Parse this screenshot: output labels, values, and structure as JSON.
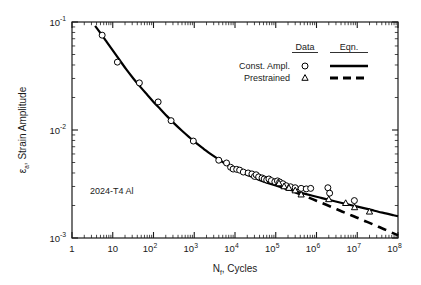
{
  "chart_data": {
    "type": "line",
    "title": "",
    "xlabel": "N_f, Cycles",
    "ylabel": "ε_a, Strain Amplitude",
    "xscale": "log",
    "yscale": "log",
    "xlim": [
      1,
      100000000
    ],
    "ylim": [
      0.001,
      0.1
    ],
    "grid": false,
    "annotation": "2024-T4 Al",
    "legend": {
      "position": "top-right",
      "col_headers": [
        "Data",
        "Eqn."
      ],
      "rows": [
        {
          "label": "Const. Ampl.",
          "marker": "circle",
          "line": "solid"
        },
        {
          "label": "Prestrained",
          "marker": "triangle",
          "line": "dashed"
        }
      ]
    },
    "xticks": [
      {
        "value": 1,
        "label": "1",
        "mantissa": "",
        "exp": ""
      },
      {
        "value": 10,
        "label": "10",
        "mantissa": "10",
        "exp": ""
      },
      {
        "value": 100,
        "label": "10^2",
        "mantissa": "10",
        "exp": "2"
      },
      {
        "value": 1000,
        "label": "10^3",
        "mantissa": "10",
        "exp": "3"
      },
      {
        "value": 10000,
        "label": "10^4",
        "mantissa": "10",
        "exp": "4"
      },
      {
        "value": 100000,
        "label": "10^5",
        "mantissa": "10",
        "exp": "5"
      },
      {
        "value": 1000000,
        "label": "10^6",
        "mantissa": "10",
        "exp": "6"
      },
      {
        "value": 10000000,
        "label": "10^7",
        "mantissa": "10",
        "exp": "7"
      },
      {
        "value": 100000000,
        "label": "10^8",
        "mantissa": "10",
        "exp": "8"
      }
    ],
    "yticks": [
      {
        "value": 0.001,
        "label": "10^-3",
        "mantissa": "10",
        "exp": "-3"
      },
      {
        "value": 0.01,
        "label": "10^-2",
        "mantissa": "10",
        "exp": "-2"
      },
      {
        "value": 0.1,
        "label": "10^-1",
        "mantissa": "10",
        "exp": "-1"
      }
    ],
    "series": [
      {
        "name": "Const. Ampl.",
        "kind": "scatter",
        "marker": "circle",
        "points": [
          [
            5.5,
            0.0755
          ],
          [
            13.0,
            0.0425
          ],
          [
            45.0,
            0.0273
          ],
          [
            130.0,
            0.0182
          ],
          [
            270.0,
            0.0122
          ],
          [
            950.0,
            0.0079
          ],
          [
            4000.0,
            0.00525
          ],
          [
            6200.0,
            0.00495
          ],
          [
            7800.0,
            0.00452
          ],
          [
            9000.0,
            0.00435
          ],
          [
            11000.0,
            0.00432
          ],
          [
            13000.0,
            0.00425
          ],
          [
            16000.0,
            0.00408
          ],
          [
            21000.0,
            0.004
          ],
          [
            26000.0,
            0.00392
          ],
          [
            30000.0,
            0.00372
          ],
          [
            33000.0,
            0.00385
          ],
          [
            38000.0,
            0.00368
          ],
          [
            46000.0,
            0.0036
          ],
          [
            52000.0,
            0.00352
          ],
          [
            60000.0,
            0.00345
          ],
          [
            68000.0,
            0.00352
          ],
          [
            78000.0,
            0.0034
          ],
          [
            95000.0,
            0.00332
          ],
          [
            110000.0,
            0.00338
          ],
          [
            125000.0,
            0.0033
          ],
          [
            150000.0,
            0.00318
          ],
          [
            180000.0,
            0.00305
          ],
          [
            230000.0,
            0.00298
          ],
          [
            300000.0,
            0.00292
          ],
          [
            420000.0,
            0.00288
          ],
          [
            560000.0,
            0.00285
          ],
          [
            720000.0,
            0.00288
          ],
          [
            1900000.0,
            0.00292
          ],
          [
            2100000.0,
            0.0026
          ],
          [
            8500000.0,
            0.00222
          ]
        ]
      },
      {
        "name": "Prestrained",
        "kind": "scatter",
        "marker": "triangle",
        "points": [
          [
            120000.0,
            0.0032
          ],
          [
            160000.0,
            0.003
          ],
          [
            210000.0,
            0.0029
          ],
          [
            300000.0,
            0.00275
          ],
          [
            420000.0,
            0.00252
          ],
          [
            2000000.0,
            0.00228
          ],
          [
            5200000.0,
            0.0021
          ],
          [
            8600000.0,
            0.00192
          ],
          [
            20000000.0,
            0.00175
          ]
        ]
      },
      {
        "name": "Eqn. Const. Ampl.",
        "kind": "line",
        "style": "solid",
        "points": [
          [
            3.7,
            0.092
          ],
          [
            5.0,
            0.079
          ],
          [
            7.0,
            0.066
          ],
          [
            10.0,
            0.0545
          ],
          [
            15.0,
            0.044
          ],
          [
            22.0,
            0.036
          ],
          [
            32.0,
            0.03
          ],
          [
            47.0,
            0.0252
          ],
          [
            70.0,
            0.0212
          ],
          [
            100.0,
            0.0182
          ],
          [
            150.0,
            0.0155
          ],
          [
            220.0,
            0.0133
          ],
          [
            330.0,
            0.0114
          ],
          [
            500.0,
            0.00985
          ],
          [
            750.0,
            0.0086
          ],
          [
            1100.0,
            0.0076
          ],
          [
            1700.0,
            0.0067
          ],
          [
            2500.0,
            0.006
          ],
          [
            3800.0,
            0.0054
          ],
          [
            5600.0,
            0.00492
          ],
          [
            8500.0,
            0.0045
          ],
          [
            13000.0,
            0.00415
          ],
          [
            19000.0,
            0.00387
          ],
          [
            29000.0,
            0.00362
          ],
          [
            44000.0,
            0.0034
          ],
          [
            66000.0,
            0.00322
          ],
          [
            100000.0,
            0.00306
          ],
          [
            150000.0,
            0.00292
          ],
          [
            230000.0,
            0.00279
          ],
          [
            350000.0,
            0.00267
          ],
          [
            530000.0,
            0.00256
          ],
          [
            800000.0,
            0.00246
          ],
          [
            1200000.0,
            0.00237
          ],
          [
            1800000.0,
            0.00228
          ],
          [
            2800000.0,
            0.00219
          ],
          [
            4200000.0,
            0.00211
          ],
          [
            6400000.0,
            0.00203
          ],
          [
            9600000.0,
            0.00196
          ],
          [
            14500000.0,
            0.00189
          ],
          [
            22000000.0,
            0.00182
          ],
          [
            33000000.0,
            0.00175
          ],
          [
            50000000.0,
            0.00169
          ],
          [
            75000000.0,
            0.00163
          ],
          [
            100000000.0,
            0.00159
          ]
        ]
      },
      {
        "name": "Eqn. Prestrained",
        "kind": "line",
        "style": "dashed",
        "points": [
          [
            60000.0,
            0.00333
          ],
          [
            100000.0,
            0.00312
          ],
          [
            150000.0,
            0.00295
          ],
          [
            230000.0,
            0.00277
          ],
          [
            350000.0,
            0.0026
          ],
          [
            530000.0,
            0.00244
          ],
          [
            800000.0,
            0.00229
          ],
          [
            1200000.0,
            0.00215
          ],
          [
            1800000.0,
            0.00202
          ],
          [
            2800000.0,
            0.00188
          ],
          [
            4200000.0,
            0.00176
          ],
          [
            6400000.0,
            0.00165
          ],
          [
            9600000.0,
            0.00155
          ],
          [
            14500000.0,
            0.00145
          ],
          [
            22000000.0,
            0.00136
          ],
          [
            33000000.0,
            0.00127
          ],
          [
            50000000.0,
            0.00119
          ],
          [
            75000000.0,
            0.00111
          ],
          [
            100000000.0,
            0.00106
          ]
        ]
      }
    ]
  },
  "axis_label_parts": {
    "y_eps": "ε",
    "y_sub": "a",
    "y_rest": ", Strain Amplitude",
    "x_n": "N",
    "x_sub": "f",
    "x_rest": ", Cycles"
  },
  "colors": {
    "axis": "#1a1a1a",
    "curve": "#000000",
    "marker_stroke": "#000000",
    "marker_fill": "#ffffff",
    "background": "#ffffff"
  }
}
